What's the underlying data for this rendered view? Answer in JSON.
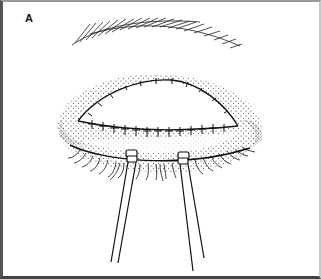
{
  "figure": {
    "panel_label": "A",
    "elements": [
      "eyebrow",
      "upper-suture-line",
      "lower-suture-line",
      "stippled-eyelid-skin",
      "eyelashes",
      "left-forceps",
      "right-forceps"
    ],
    "colors": {
      "ink": "#111111",
      "background": "#ffffff",
      "frame": "#555555"
    }
  }
}
